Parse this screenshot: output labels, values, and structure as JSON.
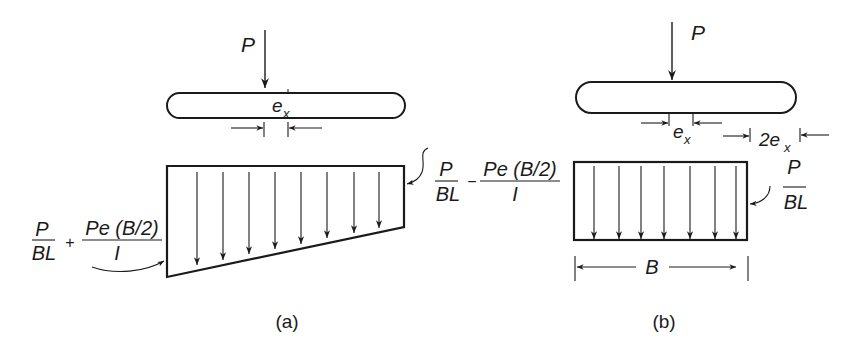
{
  "figure": {
    "panels": [
      {
        "id": "a",
        "caption": "(a)",
        "load_label": "P",
        "eccentricity_label": "e",
        "eccentricity_subscript": "x",
        "max_pressure": {
          "term1_num": "P",
          "term1_den": "BL",
          "operator": "+",
          "term2_num": "Pe (B/2)",
          "term2_den": "I"
        },
        "min_pressure": {
          "term1_num": "P",
          "term1_den": "BL",
          "operator": "−",
          "term2_num": "Pe (B/2)",
          "term2_den": "I"
        },
        "distribution": "trapezoidal",
        "arrow_count": 8
      },
      {
        "id": "b",
        "caption": "(b)",
        "load_label": "P",
        "eccentricity_label": "e",
        "eccentricity_subscript": "x",
        "double_eccentricity_label": "2e",
        "double_eccentricity_subscript": "x",
        "uniform_pressure": {
          "num": "P",
          "den": "BL"
        },
        "width_label": "B",
        "distribution": "uniform",
        "arrow_count": 7
      }
    ]
  },
  "colors": {
    "ink": "#1a1a1a",
    "background": "#ffffff"
  }
}
